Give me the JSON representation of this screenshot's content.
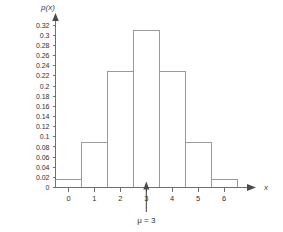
{
  "chart_data": {
    "type": "bar",
    "title": "",
    "subtitle": "",
    "xlabel": "x",
    "ylabel": "p(x)",
    "categories": [
      "0",
      "1",
      "2",
      "3",
      "4",
      "5",
      "6"
    ],
    "values": [
      0.015,
      0.088,
      0.228,
      0.31,
      0.228,
      0.088,
      0.015
    ],
    "xlim": [
      -0.5,
      6.5
    ],
    "ylim": [
      0,
      0.33
    ],
    "ytick_labels": [
      "0",
      "0.02",
      "0.04",
      "0.06",
      "0.08",
      "0.1",
      "0.12",
      "0.14",
      "0.16",
      "0.18",
      "0.2",
      "0.22",
      "0.24",
      "0.26",
      "0.28",
      "0.3",
      "0.32"
    ],
    "ytick_values": [
      0,
      0.02,
      0.04,
      0.06,
      0.08,
      0.1,
      0.12,
      0.14,
      0.16,
      0.18,
      0.2,
      0.22,
      0.24,
      0.26,
      0.28,
      0.3,
      0.32
    ],
    "xtick_labels": [
      "0",
      "1",
      "2",
      "3",
      "4",
      "5",
      "6"
    ],
    "xtick_values": [
      0,
      1,
      2,
      3,
      4,
      5,
      6
    ],
    "grid": false,
    "legend": false,
    "bar_fill_color": "#ffffff",
    "bar_stroke_color": "#9a9a9a",
    "axis_color": "#6f6f6f",
    "text_color": "#2f2f2f",
    "background_color": "#ffffff",
    "annotations": [
      {
        "name": "mean-marker",
        "text": "μ = 3",
        "x": 3,
        "points_to_axis": true
      }
    ]
  },
  "axes": {
    "y_axis_label": "p(x)",
    "x_axis_label": "x"
  },
  "annotation": {
    "mu_label": "μ = 3"
  }
}
